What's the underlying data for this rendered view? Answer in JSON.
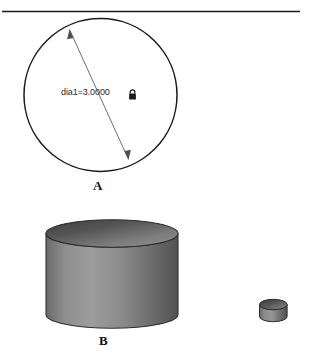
{
  "figure": {
    "divider": {
      "name": "top-rule"
    },
    "part_a": {
      "label": "A",
      "dimension_text": "dia1=3.0000",
      "lock_icon": "lock-icon",
      "shape": "circle",
      "diameter_value": "3.0000",
      "dimension_name": "dia1",
      "locked": true
    },
    "part_b": {
      "label": "B",
      "large_solid": "cylinder",
      "small_solid": "cylinder"
    }
  },
  "colors": {
    "line": "#1a1a1a",
    "dim_line": "#55585c",
    "text": "#111111",
    "dim_text": "#2b2b2b",
    "cylinder_top_dark": "#4a4a4a",
    "cylinder_top_light": "#8d8d8d",
    "cylinder_body_dark": "#5e5e5e",
    "cylinder_body_light": "#9a9a9a",
    "background": "#ffffff"
  }
}
